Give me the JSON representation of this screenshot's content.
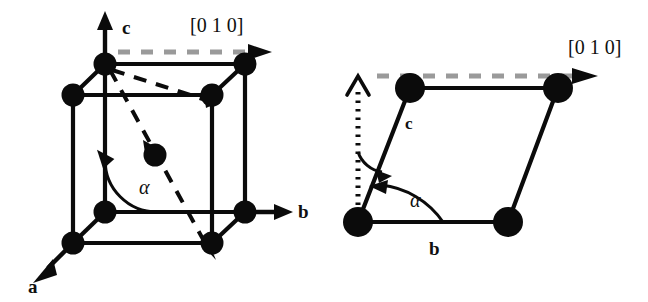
{
  "figure": {
    "caption_text": "",
    "background_color": "#ffffff",
    "ink_color": "#0b0b0b",
    "dashed_direction_color": "#9a9a9a"
  },
  "panels": [
    {
      "id": "left-panel",
      "name": "monoclinic-unit-cell-3d",
      "labels": {
        "axis_a": "a",
        "axis_b": "b",
        "axis_c": "c",
        "angle": "α",
        "direction": "[0 1 0]"
      },
      "lattice": {
        "type": "body-centered-monoclinic",
        "corner_atom_count": 8,
        "center_atom_count": 1,
        "total_atom_count": 9
      },
      "annotations": {
        "direction_arrow_style": "dashed",
        "direction_arrow_color": "#9a9a9a",
        "body_diagonal_style": "dashed",
        "body_diagonal_color": "#0b0b0b",
        "angle_marker": "arc-with-arrowhead"
      }
    },
    {
      "id": "right-panel",
      "name": "bc-plane-projection-2d",
      "labels": {
        "axis_b": "b",
        "axis_c": "c",
        "angle": "α",
        "direction": "[0 1 0]"
      },
      "lattice": {
        "type": "oblique-parallelogram",
        "corner_atom_count": 4,
        "total_atom_count": 4
      },
      "annotations": {
        "direction_arrow_style": "dashed",
        "direction_arrow_color": "#9a9a9a",
        "reference_axis_style": "dotted-vertical-arrow",
        "angle_marker": "arc-with-arrowhead",
        "second_angle_marker": "arc-with-arrowhead"
      }
    }
  ]
}
